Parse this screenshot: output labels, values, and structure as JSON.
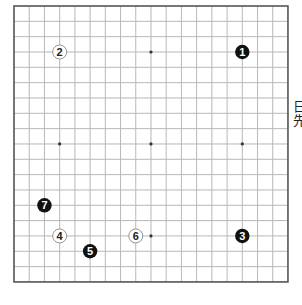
{
  "board": {
    "size": 19,
    "origin": {
      "x": 14,
      "y": 6
    },
    "spacing": {
      "x": 15.22,
      "y": 15.33
    },
    "line_color": "#b8b8b8",
    "border_color": "#555555",
    "star_points": [
      [
        4,
        4
      ],
      [
        10,
        4
      ],
      [
        16,
        4
      ],
      [
        4,
        10
      ],
      [
        10,
        10
      ],
      [
        16,
        10
      ],
      [
        4,
        16
      ],
      [
        10,
        16
      ],
      [
        16,
        16
      ]
    ],
    "visible_star_points": [
      [
        10,
        4
      ],
      [
        4,
        10
      ],
      [
        10,
        10
      ],
      [
        16,
        10
      ],
      [
        10,
        16
      ]
    ]
  },
  "stones": [
    {
      "move": "1",
      "color": "black",
      "col": 16,
      "row": 4
    },
    {
      "move": "2",
      "color": "white",
      "col": 4,
      "row": 4
    },
    {
      "move": "3",
      "color": "black",
      "col": 16,
      "row": 16
    },
    {
      "move": "4",
      "color": "white",
      "col": 4,
      "row": 16
    },
    {
      "move": "5",
      "color": "black",
      "col": 6,
      "row": 17
    },
    {
      "move": "6",
      "color": "white",
      "col": 9,
      "row": 16
    },
    {
      "move": "7",
      "color": "black",
      "col": 3,
      "row": 14
    }
  ],
  "side_text": [
    "日",
    "先"
  ]
}
